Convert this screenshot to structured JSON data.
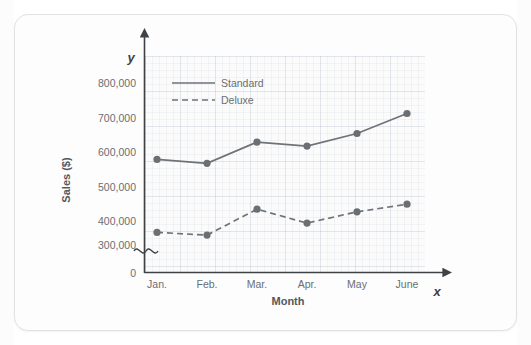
{
  "chart_data": {
    "type": "line",
    "title": "",
    "xlabel": "Month",
    "ylabel": "Sales ($)",
    "x_axis_variable": "x",
    "y_axis_variable": "y",
    "categories": [
      "Jan.",
      "Feb.",
      "Mar.",
      "Apr.",
      "May",
      "June"
    ],
    "yticklabels": [
      "0",
      "300,000",
      "400,000",
      "500,000",
      "600,000",
      "700,000",
      "800,000"
    ],
    "ylim": [
      300000,
      800000
    ],
    "y_axis_break": true,
    "y_axis_break_from": 0,
    "y_axis_break_to": 300000,
    "grid": true,
    "legend_position": "top-left-inside",
    "series": [
      {
        "name": "Standard",
        "style": "solid",
        "color": "#6f7276",
        "values": [
          570000,
          558000,
          622000,
          610000,
          648000,
          708000
        ]
      },
      {
        "name": "Deluxe",
        "style": "dashed",
        "color": "#6f7276",
        "values": [
          350000,
          342000,
          420000,
          378000,
          412000,
          435000
        ]
      }
    ]
  },
  "axis": {
    "y_label": "Sales ($)",
    "x_label": "Month",
    "y_var": "y",
    "x_var": "x"
  },
  "legend": {
    "standard_label": "Standard",
    "deluxe_label": "Deluxe"
  },
  "yticks": {
    "t0": "0",
    "t300": "300,000",
    "t400": "400,000",
    "t500": "500,000",
    "t600": "600,000",
    "t700": "700,000",
    "t800": "800,000"
  },
  "xticks": {
    "m1": "Jan.",
    "m2": "Feb.",
    "m3": "Mar.",
    "m4": "Apr.",
    "m5": "May",
    "m6": "June"
  }
}
